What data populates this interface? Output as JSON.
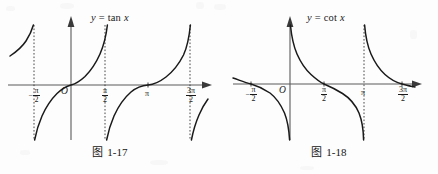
{
  "page": {
    "background_color": "#fdfdfd",
    "ink_color": "#1a1a1a",
    "axis_color": "#555555"
  },
  "figures": [
    {
      "id": "fig-left",
      "function_label": "y = tan x",
      "function_label_plain": "y = tan x",
      "caption_prefix": "图",
      "caption_number": "1-17",
      "caption": "图 1-17",
      "origin_label": "O",
      "x_ticks": [
        {
          "label": "-π/2",
          "numerator": "π",
          "denominator": "2",
          "negative": true,
          "plain": false,
          "x_px": 34
        },
        {
          "label": "π/2",
          "numerator": "π",
          "denominator": "2",
          "negative": false,
          "plain": false,
          "x_px": 105
        },
        {
          "label": "π",
          "numerator": "",
          "denominator": "",
          "negative": false,
          "plain": true,
          "x_px": 148
        },
        {
          "label": "3π/2",
          "numerator": "3π",
          "denominator": "2",
          "negative": false,
          "plain": false,
          "x_px": 190
        }
      ],
      "asymptotes_x_px": [
        34,
        105,
        190
      ],
      "asymptote_style": "dotted"
    },
    {
      "id": "fig-right",
      "function_label": "y = cot x",
      "function_label_plain": "y = cot x",
      "caption_prefix": "图",
      "caption_number": "1-18",
      "caption": "图 1-18",
      "origin_label": "O",
      "x_ticks": [
        {
          "label": "-π/2",
          "numerator": "π",
          "denominator": "2",
          "negative": true,
          "plain": false,
          "x_px": 32
        },
        {
          "label": "π/2",
          "numerator": "π",
          "denominator": "2",
          "negative": false,
          "plain": false,
          "x_px": 105
        },
        {
          "label": "π",
          "numerator": "",
          "denominator": "",
          "negative": false,
          "plain": true,
          "x_px": 145
        },
        {
          "label": "3π/2",
          "numerator": "3π",
          "denominator": "2",
          "negative": false,
          "plain": false,
          "x_px": 183
        }
      ],
      "asymptotes_x_px": [
        145
      ],
      "asymptote_style": "dotted"
    }
  ],
  "chart_data": [
    {
      "type": "line",
      "title": "y = tan x",
      "caption": "图 1-17",
      "function": "tan",
      "xlabel": "x",
      "ylabel": "y",
      "x_tick_labels": [
        "-π/2",
        "π/2",
        "π",
        "3π/2"
      ],
      "x_tick_values": [
        -1.5707963,
        1.5707963,
        3.1415927,
        4.712389
      ],
      "origin_label": "O",
      "xlim": [
        -2.6,
        5.3
      ],
      "ylim": [
        -4.2,
        4.2
      ],
      "grid": false,
      "legend": "none",
      "asymptotes": [
        -1.5707963,
        1.5707963,
        4.712389
      ],
      "asymptote_style": "dotted",
      "zeros": [
        0,
        3.1415927
      ],
      "branches": [
        {
          "domain": [
            -2.6,
            -1.5707963
          ],
          "note": "partial branch rising to +inf at -pi/2"
        },
        {
          "domain": [
            -1.5707963,
            1.5707963
          ],
          "note": "full branch through origin"
        },
        {
          "domain": [
            1.5707963,
            4.712389
          ],
          "note": "full branch through pi"
        },
        {
          "domain": [
            4.712389,
            5.3
          ],
          "note": "partial branch falling from -inf at 3pi/2"
        }
      ]
    },
    {
      "type": "line",
      "title": "y = cot x",
      "caption": "图 1-18",
      "function": "cot",
      "xlabel": "x",
      "ylabel": "y",
      "x_tick_labels": [
        "-π/2",
        "π/2",
        "π",
        "3π/2"
      ],
      "x_tick_values": [
        -1.5707963,
        1.5707963,
        3.1415927,
        4.712389
      ],
      "origin_label": "O",
      "xlim": [
        -2.4,
        5.6
      ],
      "ylim": [
        -4.2,
        4.2
      ],
      "grid": false,
      "legend": "none",
      "asymptotes": [
        0,
        3.1415927
      ],
      "asymptote_style": "dotted",
      "zeros": [
        -1.5707963,
        1.5707963,
        4.712389
      ],
      "branches": [
        {
          "domain": [
            -2.4,
            0
          ],
          "note": "branch crossing zero at -pi/2, falling to -inf at 0"
        },
        {
          "domain": [
            0,
            3.1415927
          ],
          "note": "full branch crossing zero at pi/2"
        },
        {
          "domain": [
            3.1415927,
            5.6
          ],
          "note": "branch crossing zero at 3pi/2"
        }
      ]
    }
  ]
}
